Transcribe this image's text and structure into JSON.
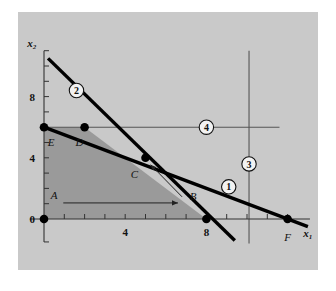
{
  "figure": {
    "background_color": "#ffffff",
    "panel_color": "#c9c9c9",
    "panel_color_light": "#c4c4c4",
    "feasible_region_color": "#9a9a9a",
    "line_color": "#000000",
    "thin_line_color": "#555555",
    "panel": {
      "x": 18,
      "y": 12,
      "width": 300,
      "height": 258
    }
  },
  "axes": {
    "x_label": "x₁",
    "y_label": "x₂",
    "x_ticks": [
      {
        "value": 0,
        "label": "0"
      },
      {
        "value": 1,
        "label": ""
      },
      {
        "value": 2,
        "label": ""
      },
      {
        "value": 3,
        "label": ""
      },
      {
        "value": 4,
        "label": "4"
      },
      {
        "value": 5,
        "label": ""
      },
      {
        "value": 6,
        "label": ""
      },
      {
        "value": 7,
        "label": ""
      },
      {
        "value": 8,
        "label": "8"
      },
      {
        "value": 9,
        "label": ""
      },
      {
        "value": 10,
        "label": ""
      },
      {
        "value": 11,
        "label": ""
      },
      {
        "value": 12,
        "label": ""
      }
    ],
    "y_ticks": [
      {
        "value": 0,
        "label": "0"
      },
      {
        "value": 1,
        "label": ""
      },
      {
        "value": 2,
        "label": ""
      },
      {
        "value": 3,
        "label": ""
      },
      {
        "value": 4,
        "label": "4"
      },
      {
        "value": 5,
        "label": ""
      },
      {
        "value": 6,
        "label": ""
      },
      {
        "value": 7,
        "label": ""
      },
      {
        "value": 8,
        "label": "8"
      },
      {
        "value": 9,
        "label": ""
      },
      {
        "value": 10,
        "label": ""
      }
    ],
    "xlim": [
      -0.8,
      13.2
    ],
    "ylim": [
      -1.6,
      11.2
    ]
  },
  "chart_data": {
    "type": "line",
    "title": "",
    "xlabel": "x₁",
    "ylabel": "x₂",
    "xlim": [
      -0.8,
      13.2
    ],
    "ylim": [
      -1.6,
      11.2
    ],
    "grid": false,
    "legend": "inline-circled-badges",
    "series": [
      {
        "name": "1",
        "badge": "1",
        "style": "thick",
        "points": [
          [
            0,
            6
          ],
          [
            13.0,
            -0.5
          ]
        ],
        "badge_at": [
          9.1,
          2.1
        ]
      },
      {
        "name": "2",
        "badge": "2",
        "style": "thick",
        "points": [
          [
            0.2,
            10.5
          ],
          [
            9.4,
            -1.4
          ]
        ],
        "badge_at": [
          1.6,
          8.4
        ]
      },
      {
        "name": "3",
        "badge": "3",
        "style": "thin",
        "points": [
          [
            10.1,
            11.0
          ],
          [
            10.1,
            -1.6
          ]
        ],
        "badge_at": [
          10.1,
          3.6
        ]
      },
      {
        "name": "4",
        "badge": "4",
        "style": "thin",
        "points": [
          [
            0,
            6
          ],
          [
            11.6,
            6
          ]
        ],
        "badge_at": [
          8.0,
          6.0
        ]
      }
    ],
    "feasible_region": {
      "fill": "#9a9a9a",
      "vertices": [
        [
          0,
          0
        ],
        [
          0,
          6
        ],
        [
          2,
          6
        ],
        [
          8,
          0
        ]
      ]
    },
    "points": [
      {
        "label": "A",
        "x": 0.55,
        "y": 1.05,
        "marker": false,
        "label_dx": -0.05,
        "label_dy": 0.55
      },
      {
        "label": "B",
        "x": 7.0,
        "y": 1.05,
        "marker": false,
        "label_dx": 0.35,
        "label_dy": 0.45
      },
      {
        "label": "C",
        "x": 5.0,
        "y": 4.0,
        "marker": true,
        "label_dx": -0.55,
        "label_dy": -1.05
      },
      {
        "label": "D",
        "x": 2.0,
        "y": 6.0,
        "marker": true,
        "label_dx": -0.25,
        "label_dy": -0.95
      },
      {
        "label": "E",
        "x": 0.0,
        "y": 6.0,
        "marker": true,
        "label_dx": 0.35,
        "label_dy": -0.95
      },
      {
        "label": "F",
        "x": 12.0,
        "y": 0.0,
        "marker": true,
        "label_dx": 0.0,
        "label_dy": -1.2
      },
      {
        "label": "",
        "x": 0.0,
        "y": 0.0,
        "marker": true,
        "label_dx": 0,
        "label_dy": 0
      },
      {
        "label": "",
        "x": 8.0,
        "y": 0.0,
        "marker": true,
        "label_dx": 0,
        "label_dy": 0
      }
    ],
    "arrows": [
      {
        "name": "a-to-b",
        "from": [
          0.95,
          1.05
        ],
        "to": [
          6.6,
          1.05
        ]
      },
      {
        "name": "b-to-c",
        "from": [
          6.8,
          1.45
        ],
        "to": [
          5.25,
          3.55
        ]
      }
    ]
  }
}
